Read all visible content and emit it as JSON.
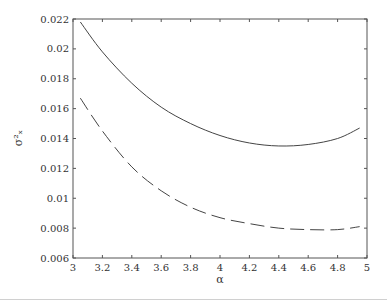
{
  "chart_data": {
    "type": "line",
    "title": "",
    "xlabel": "α",
    "ylabel": "σ²ₓ",
    "xlim": [
      3,
      5
    ],
    "ylim": [
      0.006,
      0.022
    ],
    "xticks": [
      "3",
      "3.2",
      "3.4",
      "3.6",
      "3.8",
      "4",
      "4.2",
      "4.4",
      "4.6",
      "4.8",
      "5"
    ],
    "yticks": [
      "0.006",
      "0.008",
      "0.01",
      "0.012",
      "0.014",
      "0.016",
      "0.018",
      "0.02",
      "0.022"
    ],
    "grid": false,
    "legend": null,
    "series": [
      {
        "name": "solid",
        "style": "solid",
        "x": [
          3.05,
          3.2,
          3.4,
          3.6,
          3.8,
          4.0,
          4.2,
          4.4,
          4.6,
          4.8,
          4.95
        ],
        "y": [
          0.0218,
          0.0198,
          0.0177,
          0.0161,
          0.015,
          0.0142,
          0.0137,
          0.0135,
          0.0136,
          0.014,
          0.0147
        ]
      },
      {
        "name": "dashed",
        "style": "dashed",
        "x": [
          3.05,
          3.2,
          3.4,
          3.6,
          3.8,
          4.0,
          4.2,
          4.4,
          4.6,
          4.8,
          4.95
        ],
        "y": [
          0.0167,
          0.0145,
          0.0121,
          0.0105,
          0.0094,
          0.0087,
          0.0083,
          0.008,
          0.0079,
          0.0079,
          0.0081
        ]
      }
    ]
  }
}
